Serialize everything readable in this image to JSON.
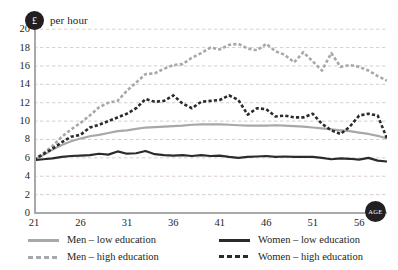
{
  "unit_badge": {
    "symbol": "£",
    "label": "per hour"
  },
  "axis_badge": {
    "label": "AGE"
  },
  "colors": {
    "low_men": "#a6a8ab",
    "high_men": "#a6a8ab",
    "low_women": "#2b2b2b",
    "high_women": "#2b2b2b",
    "gridline": "#c9b8b0",
    "axis": "#a7a9ac",
    "text": "#231f20"
  },
  "legend": {
    "items": [
      {
        "label": "Men – low education",
        "style": "solid",
        "color": "#a6a8ab"
      },
      {
        "label": "Men – high education",
        "style": "dashed",
        "color": "#a6a8ab"
      },
      {
        "label": "Women – low education",
        "style": "solid",
        "color": "#2b2b2b"
      },
      {
        "label": "Women – high education",
        "style": "dashed",
        "color": "#2b2b2b"
      }
    ]
  },
  "chart_data": {
    "type": "line",
    "title": "",
    "subtitle": "",
    "xlabel": "AGE",
    "ylabel": "£ per hour",
    "xlim": [
      21,
      59
    ],
    "ylim": [
      0,
      21
    ],
    "grid": true,
    "grid_axis": "y",
    "legend_position": "bottom",
    "yticks": [
      0,
      2,
      4,
      6,
      8,
      10,
      12,
      14,
      16,
      18,
      20
    ],
    "xticks": [
      21,
      26,
      31,
      36,
      41,
      46,
      51,
      56
    ],
    "x": [
      21,
      22,
      23,
      24,
      25,
      26,
      27,
      28,
      29,
      30,
      31,
      32,
      33,
      34,
      35,
      36,
      37,
      38,
      39,
      40,
      41,
      42,
      43,
      44,
      45,
      46,
      47,
      48,
      49,
      50,
      51,
      52,
      53,
      54,
      55,
      56,
      57,
      58,
      59
    ],
    "series": [
      {
        "name": "Men – low education",
        "style": "solid",
        "color": "#a6a8ab",
        "values": [
          5.8,
          6.3,
          6.9,
          7.4,
          7.8,
          8.1,
          8.35,
          8.5,
          8.7,
          8.9,
          9.0,
          9.15,
          9.3,
          9.35,
          9.4,
          9.45,
          9.5,
          9.6,
          9.65,
          9.65,
          9.65,
          9.6,
          9.55,
          9.5,
          9.5,
          9.5,
          9.55,
          9.5,
          9.45,
          9.4,
          9.3,
          9.2,
          9.1,
          9.0,
          8.9,
          8.75,
          8.6,
          8.4,
          8.1
        ]
      },
      {
        "name": "Men – high education",
        "style": "dashed",
        "color": "#a6a8ab",
        "values": [
          5.8,
          6.5,
          7.3,
          8.3,
          9.1,
          9.8,
          10.6,
          11.5,
          12.0,
          12.2,
          13.3,
          14.2,
          15.1,
          15.2,
          15.7,
          16.1,
          16.2,
          16.9,
          17.4,
          18.0,
          17.8,
          18.3,
          18.4,
          17.9,
          17.7,
          18.4,
          17.6,
          17.2,
          16.4,
          17.5,
          16.5,
          15.5,
          17.4,
          15.9,
          16.1,
          15.9,
          15.5,
          14.9,
          14.4
        ]
      },
      {
        "name": "Women – low education",
        "style": "solid",
        "color": "#2b2b2b",
        "values": [
          5.75,
          5.85,
          5.95,
          6.1,
          6.2,
          6.25,
          6.3,
          6.45,
          6.35,
          6.7,
          6.45,
          6.5,
          6.75,
          6.4,
          6.3,
          6.25,
          6.3,
          6.2,
          6.3,
          6.2,
          6.25,
          6.1,
          6.0,
          6.1,
          6.15,
          6.2,
          6.1,
          6.15,
          6.1,
          6.1,
          6.1,
          6.0,
          5.85,
          5.95,
          5.9,
          5.8,
          6.0,
          5.7,
          5.6
        ]
      },
      {
        "name": "Women – high education",
        "style": "dashed",
        "color": "#2b2b2b",
        "values": [
          5.8,
          6.4,
          7.0,
          7.7,
          8.3,
          8.5,
          9.3,
          9.6,
          10.0,
          10.4,
          10.8,
          11.4,
          12.4,
          12.1,
          12.2,
          12.8,
          11.9,
          11.4,
          12.1,
          12.2,
          12.3,
          12.8,
          12.3,
          10.7,
          11.4,
          11.3,
          10.5,
          10.6,
          10.4,
          10.4,
          10.8,
          9.7,
          9.0,
          8.6,
          9.4,
          10.6,
          10.8,
          10.6,
          8.1
        ]
      }
    ]
  }
}
